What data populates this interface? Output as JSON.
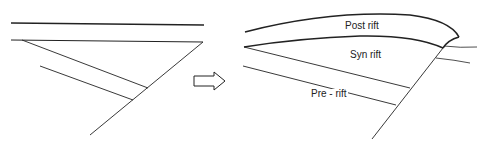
{
  "diagram": {
    "before_panel": {
      "description": "Pre-deformation stratigraphy cut by a normal fault"
    },
    "transition_arrow": {
      "icon": "right-arrow-icon"
    },
    "after_panel": {
      "labels": {
        "post_rift": "Post rift",
        "syn_rift": "Syn rift",
        "pre_rift": "Pre - rift"
      }
    },
    "colors": {
      "line": "#222222",
      "background": "#ffffff"
    }
  }
}
